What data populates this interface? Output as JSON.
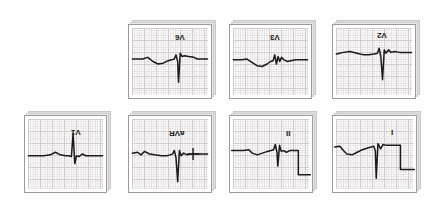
{
  "figure": {
    "kind": "12-lead-ecg-panel-grid",
    "background_color": "#ffffff",
    "paper_color": "#ffffff",
    "grid_color": "#cfc7c7",
    "grid_fine_color": "#e6dede",
    "trace_color": "#1a1a1a",
    "panel_border_color": "#9a9a9a",
    "shadow_sheet_color": "#dcdcdc",
    "label_orientation": "rotated-180"
  },
  "chart_data": {
    "type": "line",
    "title": "",
    "xlabel": "",
    "ylabel": "",
    "grid": true,
    "legend": "none",
    "note": "Seven ECG lead strips on graph paper; each panel plots voltage vs time for one lead. Lead labels are printed rotated 180 degrees.",
    "series": [
      {
        "name": "V6",
        "label": "V6",
        "row": 0,
        "col": 1,
        "baseline": 0,
        "features": {
          "p_wave": "small negative-positive deflection",
          "qrs": "deep narrow S wave",
          "t_wave": "small positive"
        },
        "points": "M4,41 L16,41 L22,39 L28,44 L34,47 L40,46 L46,43 L50,42 L53,41 L55,36 L57,44 L58,69 L60,34 L62,38 L65,37 L70,38 L76,39 L80,41 L92,41"
      },
      {
        "name": "V3",
        "label": "V3",
        "row": 0,
        "col": 2,
        "baseline": 0,
        "features": {
          "p_wave": "broad negative trough",
          "qrs": "small rS complex",
          "t_wave": "low amplitude"
        },
        "points": "M4,42 L14,42 L20,41 L26,45 L32,49 L38,50 L44,47 L48,44 L51,43 L53,36 L55,47 L57,38 L59,44 L61,39 L64,42 L68,44 L72,43 L78,42 L92,42"
      },
      {
        "name": "V2",
        "label": "V2",
        "row": 0,
        "col": 3,
        "baseline": 0,
        "features": {
          "p_wave": "gentle rise",
          "qrs": "deep S wave",
          "t_wave": "notched positive"
        },
        "points": "M4,35 L12,33 L20,32 L28,34 L36,36 L42,36 L48,35 L52,34 L54,28 L56,38 L58,66 L60,30 L62,34 L65,30 L68,33 L72,32 L78,33 L84,33 L92,33"
      },
      {
        "name": "V1",
        "label": "V1",
        "row": 1,
        "col": 0,
        "baseline": 0,
        "features": {
          "p_wave": "small rounded bump",
          "qrs": "tall R wave",
          "t_wave": "small positive"
        },
        "points": "M4,46 L22,46 L30,45 L36,42 L42,45 L48,46 L52,46 L55,47 L57,20 L59,55 L61,46 L64,47 L68,44 L72,46 L78,46 L92,46"
      },
      {
        "name": "aVR",
        "label": "aVR",
        "row": 1,
        "col": 1,
        "baseline": 0,
        "features": {
          "p_wave": "small negative waves",
          "qrs": "deep QS complex",
          "t_wave": "negative, calibration mark present"
        },
        "points": "M4,43 L10,42 L14,45 L18,41 L24,44 L30,45 L38,46 L44,46 L48,45 L51,44 L53,40 L55,48 L57,76 L59,40 L61,46 L64,43 L68,45 L72,44 L78,44 L92,44",
        "calibration_mark": true
      },
      {
        "name": "II",
        "label": "II",
        "row": 1,
        "col": 2,
        "baseline": 0,
        "features": {
          "p_wave": "small notch",
          "qrs": "narrow QRS",
          "t_wave": "low",
          "step": "square step down at right edge"
        },
        "points": "M2,40 L16,40 L22,39 L26,43 L32,45 L38,43 L44,41 L48,40 L51,39 L53,33 L55,42 L56,58 L58,34 L60,41 L63,40 L66,42 L70,40 L76,40 L80,40 L80,68 L94,68",
        "step_down": true
      },
      {
        "name": "I",
        "label": "I",
        "row": 1,
        "col": 3,
        "baseline": 0,
        "features": {
          "p_wave": "broad negative trough",
          "qrs": "deep Q then R",
          "t_wave": "plateau",
          "step": "square step down at right edge"
        },
        "points": "M2,36 L8,35 L12,40 L16,44 L22,45 L28,42 L34,39 L40,37 L44,36 L47,35 L49,40 L50,72 L52,32 L55,38 L58,33 L62,34 L68,34 L74,34 L78,34 L78,62 L94,62",
        "step_down": true
      }
    ]
  },
  "panels": [
    {
      "id": "panel-v6",
      "lead": "V6",
      "left": 128,
      "top": 24,
      "width": 84,
      "height": 75,
      "label_left": 46,
      "label_top": 8
    },
    {
      "id": "panel-v3",
      "lead": "V3",
      "left": 229,
      "top": 24,
      "width": 83,
      "height": 75,
      "label_left": 40,
      "label_top": 8
    },
    {
      "id": "panel-v2",
      "lead": "V2",
      "left": 332,
      "top": 24,
      "width": 84,
      "height": 75,
      "label_left": 44,
      "label_top": 6
    },
    {
      "id": "panel-v1",
      "lead": "V1",
      "left": 24,
      "top": 115,
      "width": 83,
      "height": 78,
      "label_left": 46,
      "label_top": 12
    },
    {
      "id": "panel-avr",
      "lead": "aVR",
      "left": 128,
      "top": 115,
      "width": 84,
      "height": 78,
      "label_left": 40,
      "label_top": 13
    },
    {
      "id": "panel-ii",
      "lead": "II",
      "left": 229,
      "top": 115,
      "width": 84,
      "height": 78,
      "label_left": 56,
      "label_top": 13
    },
    {
      "id": "panel-i",
      "lead": "I",
      "left": 332,
      "top": 115,
      "width": 85,
      "height": 78,
      "label_left": 58,
      "label_top": 12
    }
  ]
}
